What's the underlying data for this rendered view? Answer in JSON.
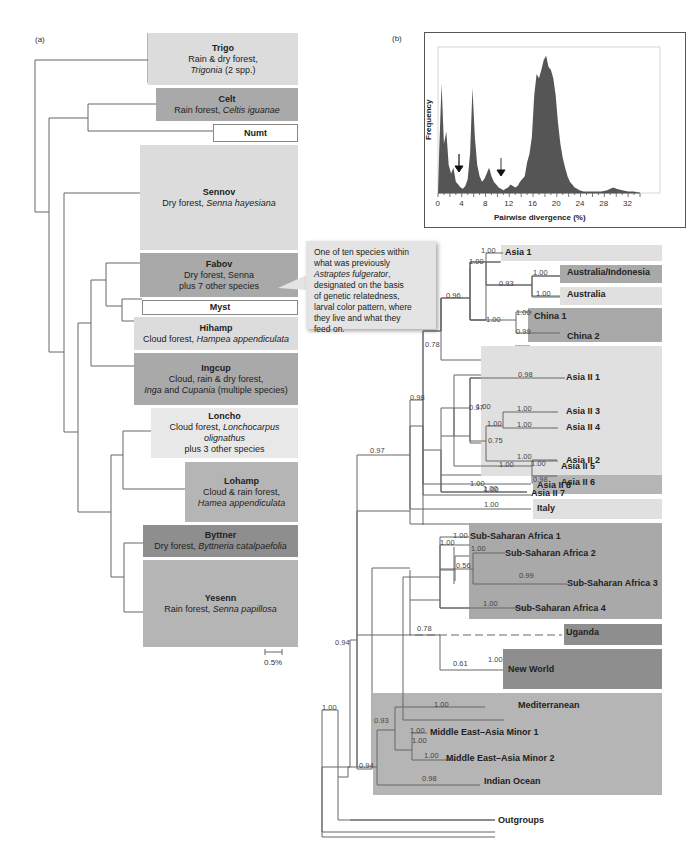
{
  "panel_a": {
    "label": "(a)",
    "scale_bar": "0.5%",
    "clades": [
      {
        "name": "Trigo",
        "line1": "Rain & dry forest,",
        "line2_italic": "Trigonia",
        "line2_rest": " (2 spp.)",
        "shade": "#dcdcdc"
      },
      {
        "name": "Celt",
        "line1_plain": "Rain forest, ",
        "line1_italic": "Celtis iguanae",
        "shade": "#a9a9a9"
      },
      {
        "name": "Numt",
        "shade": "#ffffff"
      },
      {
        "name": "Sennov",
        "line1_plain": "Dry forest, ",
        "line1_italic": "Senna hayesiana",
        "shade": "#dcdcdc"
      },
      {
        "name": "Fabov",
        "line1": "Dry forest, Senna",
        "line2": "plus 7 other species",
        "shade": "#a9a9a9"
      },
      {
        "name": "Myst",
        "shade": "#ffffff"
      },
      {
        "name": "Hihamp",
        "line1_plain": "Cloud forest, ",
        "line1_italic": "Hampea appendiculata",
        "shade": "#dcdcdc"
      },
      {
        "name": "Ingcup",
        "line1": "Cloud, rain & dry forest,",
        "line2_italic_a": "Inga",
        "line2_mid": " and ",
        "line2_italic_b": "Cupania",
        "line2_rest": " (multiple species)",
        "shade": "#a9a9a9"
      },
      {
        "name": "Loncho",
        "line1_plain": "Cloud forest, ",
        "line1_italic": "Lonchocarpus olignathus",
        "line2": "plus 3 other species",
        "shade": "#e8e8e8"
      },
      {
        "name": "Lohamp",
        "line1": "Cloud & rain forest,",
        "line2_italic": "Hamea appendiculata",
        "shade": "#b5b5b5"
      },
      {
        "name": "Byttner",
        "line1_plain": "Dry forest, ",
        "line1_italic": "Byttneria catalpaefolia",
        "shade": "#8e8e8e"
      },
      {
        "name": "Yesenn",
        "line1_plain": "Rain forest, ",
        "line1_italic": "Senna papillosa",
        "shade": "#b5b5b5"
      }
    ]
  },
  "callout": {
    "line1": "One of ten species within",
    "line2": "what was previously",
    "line3_italic": "Astraptes fulgerator",
    "line3_rest": ",",
    "line4": "designated on the basis",
    "line5": "of genetic relatedness,",
    "line6": "larval color pattern, where",
    "line7": "they live and what they",
    "line8": "feed on."
  },
  "panel_b": {
    "label": "(b)",
    "ylabel": "Frequency",
    "xlabel": "Pairwise divergence (%)",
    "ticks": [
      "0",
      "4",
      "8",
      "12",
      "16",
      "20",
      "24",
      "28",
      "32"
    ]
  },
  "chart_data": {
    "type": "bar",
    "title": "",
    "xlabel": "Pairwise divergence (%)",
    "ylabel": "Frequency",
    "xlim": [
      0,
      34
    ],
    "x_ticks": [
      0,
      4,
      8,
      12,
      16,
      20,
      24,
      28,
      32
    ],
    "x": [
      0.2,
      0.6,
      1.0,
      1.4,
      1.8,
      2.2,
      2.6,
      3.0,
      3.4,
      3.8,
      4.2,
      4.6,
      5.0,
      5.4,
      5.8,
      6.2,
      6.6,
      7.0,
      7.4,
      7.8,
      8.2,
      8.6,
      9.0,
      9.4,
      9.8,
      10.2,
      10.6,
      11.0,
      11.4,
      11.8,
      12.2,
      12.6,
      13.0,
      13.4,
      13.8,
      14.2,
      14.6,
      15.0,
      15.4,
      15.8,
      16.2,
      16.6,
      17.0,
      17.4,
      17.8,
      18.2,
      18.6,
      19.0,
      19.4,
      19.8,
      20.2,
      20.6,
      21.0,
      21.4,
      21.8,
      22.2,
      22.6,
      23.0,
      23.4,
      23.8,
      24.5,
      26,
      27.5,
      28.5,
      29,
      29.5,
      30,
      31,
      32,
      33
    ],
    "values": [
      30,
      78,
      35,
      44,
      20,
      14,
      18,
      8,
      6,
      4,
      3,
      5,
      10,
      28,
      75,
      40,
      20,
      12,
      8,
      10,
      14,
      18,
      12,
      8,
      6,
      4,
      3,
      2,
      3,
      4,
      6,
      5,
      4,
      5,
      8,
      10,
      12,
      22,
      28,
      40,
      70,
      85,
      82,
      88,
      95,
      98,
      90,
      88,
      82,
      70,
      50,
      35,
      25,
      18,
      12,
      8,
      6,
      4,
      3,
      2,
      1,
      1,
      1,
      2,
      3,
      4,
      3,
      2,
      1,
      1
    ],
    "annotations": [
      {
        "type": "arrow",
        "x": 3.6,
        "note": "gap between intraspecific and interspecific divergence"
      },
      {
        "type": "arrow",
        "x": 10.8,
        "note": "gap"
      }
    ],
    "grid": false
  },
  "panel_c": {
    "clades": [
      {
        "name": "Asia 1",
        "support": "1.00"
      },
      {
        "name": "Australia/Indonesia",
        "support": "1.00"
      },
      {
        "name": "Australia",
        "support": "1.00"
      },
      {
        "name": "China 1",
        "support": "1.00"
      },
      {
        "name": "China 2",
        "support": "0.99"
      },
      {
        "name": "Asia II 1",
        "support": "0.98"
      },
      {
        "name": "Asia II 3",
        "support": "1.00"
      },
      {
        "name": "Asia II 4",
        "support": "1.00"
      },
      {
        "name": "Asia II 2",
        "support": "1.00"
      },
      {
        "name": "Asia II 5",
        "support": "1.00"
      },
      {
        "name": "Asia II 6",
        "support": "0.98"
      },
      {
        "name": "Asia II 7",
        "support": "1.00"
      },
      {
        "name": "Asia II 8",
        "support": "1.00"
      },
      {
        "name": "Italy",
        "support": "1.00"
      },
      {
        "name": "Sub-Saharan Africa 1",
        "support": "1.00"
      },
      {
        "name": "Sub-Saharan Africa 2",
        "support": "1.00"
      },
      {
        "name": "Sub-Saharan Africa 3",
        "support": "0.99"
      },
      {
        "name": "Sub-Saharan Africa 4",
        "support": "1.00"
      },
      {
        "name": "Uganda",
        "support": ""
      },
      {
        "name": "New World",
        "support": "1.00"
      },
      {
        "name": "Mediterranean",
        "support": "1.00"
      },
      {
        "name": "Middle East–Asia Minor 1",
        "support": "1.00"
      },
      {
        "name": "Middle East–Asia Minor 2",
        "support": "1.00"
      },
      {
        "name": "Indian Ocean",
        "support": "0.98"
      },
      {
        "name": "Outgroups",
        "support": ""
      }
    ],
    "internal_supports": {
      "asia1_aus": "1.00",
      "aus_pair": "0.93",
      "asia_china": "0.96",
      "china_pair": "1.00",
      "asiaII_upper": "1.00",
      "asiaII_34_2": "0.75",
      "asiaII_3_4": "1.00",
      "asiaII_56": "1.00",
      "asiaII_top": "0.97",
      "asiaII_8": "1.00",
      "asia_all": "0.78",
      "asia_italy": "0.98",
      "main": "0.97",
      "ssa_root": "1.00",
      "ssa_23": "0.56",
      "africa_nw": "0.78",
      "newworld_inner": "0.61",
      "med_group": "0.93",
      "mea_pair": "1.00",
      "med_root": "0.94",
      "ingroup": "0.94",
      "root": "1.00"
    }
  }
}
